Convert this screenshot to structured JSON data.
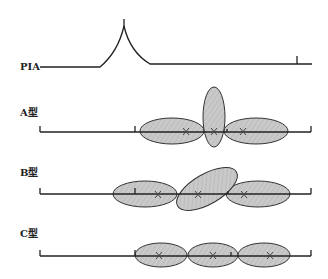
{
  "figure": {
    "rows": [
      {
        "id": "pia",
        "label": "PIA"
      },
      {
        "id": "type-a",
        "label": "A型"
      },
      {
        "id": "type-b",
        "label": "B型"
      },
      {
        "id": "type-c",
        "label": "C型"
      }
    ]
  },
  "colors": {
    "line": "#222222",
    "ellipse_fill": "#c8c8c8",
    "ellipse_stroke": "#333333",
    "hatch": "#b4b4b4"
  }
}
